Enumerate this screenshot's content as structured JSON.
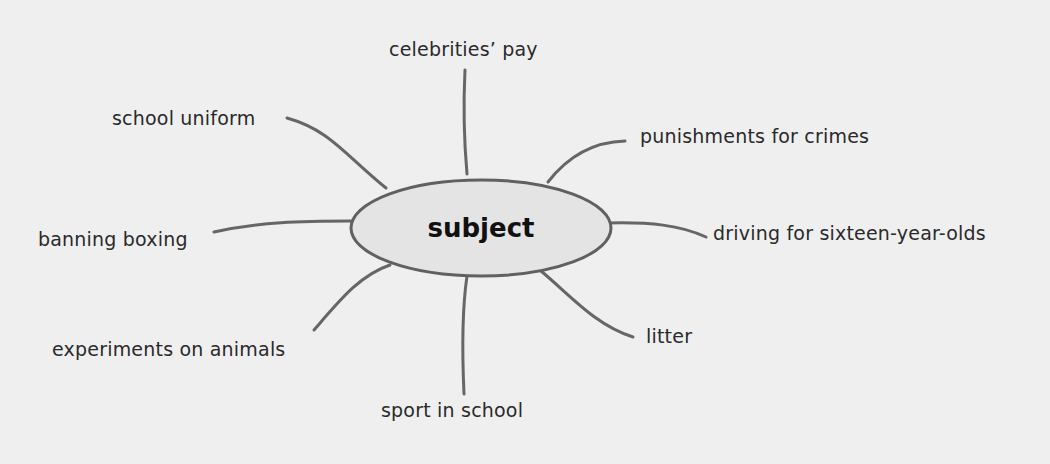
{
  "diagram": {
    "type": "mind-map",
    "center": {
      "label": "subject",
      "fill": "#e4e4e4",
      "stroke": "#606060"
    },
    "line_color": "#666666",
    "branches": [
      {
        "label": "celebrities’ pay"
      },
      {
        "label": "school uniform"
      },
      {
        "label": "punishments for crimes"
      },
      {
        "label": "banning boxing"
      },
      {
        "label": "driving for sixteen-year-olds"
      },
      {
        "label": "experiments on animals"
      },
      {
        "label": "litter"
      },
      {
        "label": "sport in school"
      }
    ]
  }
}
